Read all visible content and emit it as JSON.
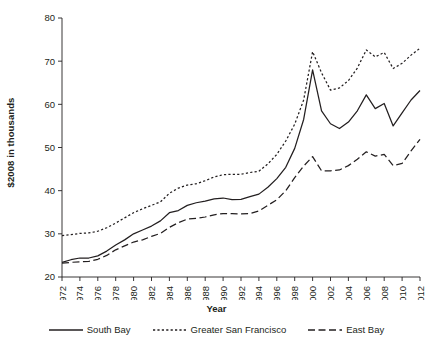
{
  "chart_data": {
    "type": "line",
    "title": "",
    "xlabel": "Year",
    "ylabel": "$2008 in thousands",
    "xlim": [
      1972,
      2012
    ],
    "ylim": [
      20,
      80
    ],
    "yticks": [
      20,
      30,
      40,
      50,
      60,
      70,
      80
    ],
    "xticks": [
      1972,
      1974,
      1976,
      1978,
      1980,
      1982,
      1984,
      1986,
      1988,
      1990,
      1992,
      1994,
      1996,
      1998,
      2000,
      2002,
      2004,
      2006,
      2008,
      2010,
      2012
    ],
    "grid": false,
    "legend_position": "bottom",
    "x": [
      1972,
      1973,
      1974,
      1975,
      1976,
      1977,
      1978,
      1979,
      1980,
      1981,
      1982,
      1983,
      1984,
      1985,
      1986,
      1987,
      1988,
      1989,
      1990,
      1991,
      1992,
      1993,
      1994,
      1995,
      1996,
      1997,
      1998,
      1999,
      2000,
      2001,
      2002,
      2003,
      2004,
      2005,
      2006,
      2007,
      2008,
      2009,
      2010,
      2011,
      2012
    ],
    "series": [
      {
        "name": "South Bay",
        "style": "solid",
        "values": [
          23.4,
          24.0,
          24.4,
          24.4,
          24.9,
          26.0,
          27.4,
          28.6,
          30.0,
          30.9,
          31.8,
          33.0,
          34.9,
          35.4,
          36.6,
          37.2,
          37.6,
          38.1,
          38.3,
          37.9,
          38.0,
          38.6,
          39.2,
          40.8,
          42.8,
          45.4,
          49.8,
          56.5,
          68.0,
          58.5,
          55.5,
          54.4,
          55.9,
          58.5,
          62.2,
          59.0,
          60.2,
          55.0,
          58.0,
          61.0,
          63.2
        ]
      },
      {
        "name": "Greater San Francisco",
        "style": "dotted",
        "values": [
          29.6,
          29.8,
          30.1,
          30.2,
          30.6,
          31.4,
          32.5,
          33.7,
          34.9,
          35.8,
          36.6,
          37.4,
          39.4,
          40.6,
          41.3,
          41.6,
          42.3,
          43.2,
          43.7,
          43.8,
          43.8,
          44.2,
          44.5,
          46.2,
          48.4,
          51.5,
          55.4,
          61.0,
          72.2,
          67.3,
          63.3,
          63.8,
          65.5,
          68.4,
          72.6,
          71.0,
          72.0,
          68.3,
          69.5,
          71.4,
          73.0
        ]
      },
      {
        "name": "East Bay",
        "style": "dashed",
        "values": [
          23.2,
          23.4,
          23.5,
          23.6,
          24.1,
          25.0,
          26.3,
          27.2,
          28.1,
          28.6,
          29.4,
          30.1,
          31.5,
          32.6,
          33.4,
          33.6,
          33.9,
          34.4,
          34.7,
          34.7,
          34.6,
          34.7,
          35.3,
          36.6,
          37.9,
          40.0,
          43.0,
          45.7,
          47.9,
          44.6,
          44.6,
          44.8,
          45.8,
          47.3,
          49.0,
          48.0,
          48.4,
          45.8,
          46.3,
          49.2,
          51.9
        ]
      }
    ],
    "legend": [
      {
        "label": "South Bay",
        "style": "solid"
      },
      {
        "label": "Greater San Francisco",
        "style": "dotted"
      },
      {
        "label": "East Bay",
        "style": "dashed"
      }
    ],
    "axis_color": "#231f20",
    "line_color": "#231f20"
  }
}
